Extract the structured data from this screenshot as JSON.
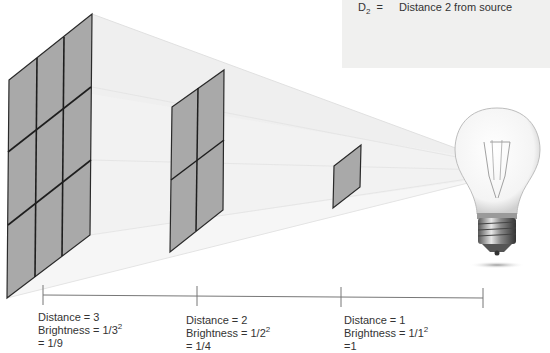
{
  "legend": {
    "symbol": "D",
    "subscript": "2",
    "equals": "=",
    "description": "Distance 2 from source"
  },
  "panels": [
    {
      "name": "panel-distance-3",
      "grid": "3x3"
    },
    {
      "name": "panel-distance-2",
      "grid": "2x2"
    },
    {
      "name": "panel-distance-1",
      "grid": "1x1"
    }
  ],
  "light_source": {
    "icon": "light-bulb-icon"
  },
  "labels": [
    {
      "distance": "Distance = 3",
      "brightness_prefix": "Brightness = 1/3",
      "exponent": "2",
      "result": "= 1/9"
    },
    {
      "distance": "Distance = 2",
      "brightness_prefix": "Brightness = 1/2",
      "exponent": "2",
      "result": "= 1/4"
    },
    {
      "distance": "Distance = 1",
      "brightness_prefix": "Brightness = 1/1",
      "exponent": "2",
      "result": "=1"
    }
  ],
  "colors": {
    "panel_fill": "#a9a9a9",
    "panel_stroke": "#2a2a2a",
    "beam_fill": "#ececec",
    "legend_bg": "#f0f0ef",
    "ruler": "#777777"
  }
}
